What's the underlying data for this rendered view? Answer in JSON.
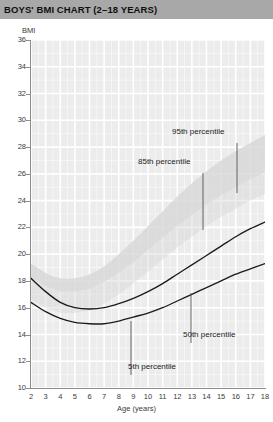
{
  "header": {
    "title": "BOYS' BMI CHART (2–18 YEARS)",
    "bar_color": "#a8a8a8"
  },
  "axes": {
    "y_caption": "BMI",
    "x_caption": "Age (years)",
    "y_ticks": [
      "36",
      "34",
      "32",
      "30",
      "28",
      "26",
      "24",
      "22",
      "20",
      "18",
      "16",
      "14",
      "12",
      "10"
    ],
    "x_ticks": [
      "2",
      "3",
      "4",
      "5",
      "6",
      "7",
      "8",
      "9",
      "10",
      "11",
      "12",
      "13",
      "14",
      "15",
      "16",
      "17",
      "18"
    ]
  },
  "annotations": {
    "p95": "95th percentile",
    "p85": "85th percentile",
    "p50": "50th percentile",
    "p5": "5th percentile"
  },
  "colors": {
    "plot_background": "#ececec",
    "gridline": "#ffffff",
    "curve": "#1c1c1c",
    "band_fill": "#d8d8d8",
    "axis": "#8d8d8d"
  },
  "chart_data": {
    "type": "line",
    "title": "BOYS' BMI CHART (2–18 YEARS)",
    "xlabel": "Age (years)",
    "ylabel": "BMI",
    "xlim": [
      2,
      18
    ],
    "ylim": [
      10,
      36
    ],
    "x_tick_step": 1,
    "y_tick_step": 2,
    "grid": true,
    "legend": "inline-annotations",
    "x": [
      2,
      3,
      4,
      5,
      6,
      7,
      8,
      9,
      10,
      11,
      12,
      13,
      14,
      15,
      16,
      17,
      18
    ],
    "series": [
      {
        "name": "95th percentile",
        "kind": "band-upper",
        "values": [
          19.3,
          18.6,
          18.2,
          18.2,
          18.5,
          19.1,
          20.0,
          21.0,
          22.1,
          23.2,
          24.3,
          25.3,
          26.2,
          27.0,
          27.7,
          28.3,
          28.9
        ]
      },
      {
        "name": "85th percentile",
        "kind": "band-lower",
        "values": [
          18.2,
          17.6,
          17.2,
          17.2,
          17.4,
          17.9,
          18.6,
          19.4,
          20.3,
          21.2,
          22.1,
          22.9,
          23.7,
          24.4,
          25.0,
          25.6,
          26.1
        ]
      },
      {
        "name": "50th percentile",
        "kind": "curve",
        "values": [
          18.2,
          17.2,
          16.4,
          16.0,
          15.9,
          16.0,
          16.3,
          16.7,
          17.2,
          17.8,
          18.5,
          19.2,
          19.9,
          20.6,
          21.3,
          21.9,
          22.4
        ]
      },
      {
        "name": "5th percentile",
        "kind": "curve",
        "values": [
          16.4,
          15.7,
          15.2,
          14.9,
          14.8,
          14.8,
          15.0,
          15.3,
          15.6,
          16.0,
          16.5,
          17.0,
          17.5,
          18.0,
          18.5,
          18.9,
          19.3
        ]
      }
    ]
  }
}
